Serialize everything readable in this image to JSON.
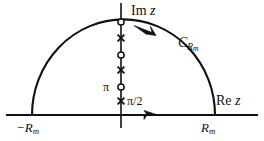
{
  "figure": {
    "background_color": "#ffffff",
    "stroke_color": "#111111"
  },
  "axes": {
    "imaginary": {
      "label_prefix": "Im",
      "label_variable": "z",
      "label_full": "Im z"
    },
    "real": {
      "label_prefix": "Re",
      "label_variable": "z",
      "label_full": "Re z"
    }
  },
  "contour": {
    "arc_label_base": "C",
    "arc_label_subscript": "Rm",
    "arc_label_full": "C_Rm",
    "arc_direction": "counterclockwise",
    "radius_label_left": "−R",
    "radius_subscript_left": "m",
    "radius_label_left_full": "−R_m",
    "radius_label_right": "R",
    "radius_subscript_right": "m",
    "radius_label_right_full": "R_m"
  },
  "markers": {
    "pole_label": "π",
    "zero_label": "π/2",
    "points": [
      {
        "name": "circle-top",
        "type": "open-circle",
        "x": 121,
        "y": 22,
        "label": ""
      },
      {
        "name": "cross-1",
        "type": "cross",
        "x": 121,
        "y": 38,
        "label": ""
      },
      {
        "name": "circle-2",
        "type": "open-circle",
        "x": 121,
        "y": 55,
        "label": ""
      },
      {
        "name": "cross-2",
        "type": "cross",
        "x": 121,
        "y": 70,
        "label": ""
      },
      {
        "name": "circle-pi",
        "type": "open-circle",
        "x": 121,
        "y": 87,
        "label": "π"
      },
      {
        "name": "cross-pi-over-2",
        "type": "cross",
        "x": 121,
        "y": 101,
        "label": "π/2"
      }
    ]
  },
  "arrows": {
    "real_axis_arrow_direction": "right",
    "arc_arrow_direction": "left"
  }
}
